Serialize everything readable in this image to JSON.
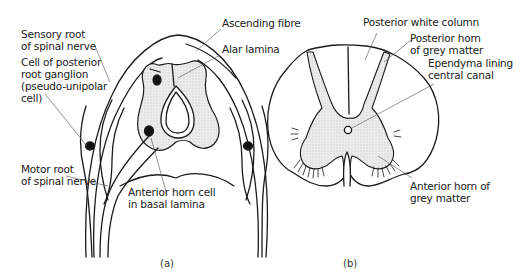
{
  "figure_a": {
    "caption": "(a)",
    "labels": {
      "sensory_root": "Sensory root\nof spinal nerve",
      "ganglion_cell": "Cell of posterior\nroot ganglion\n(pseudo-unipolar\ncell)",
      "motor_root": "Motor root\nof spinal nerve",
      "ascending_fibre": "Ascending fibre",
      "alar_lamina": "Alar lamina",
      "anterior_horn_cell": "Anterior horn cell\nin basal lamina"
    }
  },
  "figure_b": {
    "caption": "(b)",
    "labels": {
      "posterior_white_column": "Posterior white column",
      "posterior_horn": "Posterior horn\nof grey matter",
      "ependyma": "Ependyma lining\ncentral canal",
      "anterior_horn": "Anterior horn of\ngrey matter"
    }
  },
  "colors": {
    "line": "#1a1a1a",
    "grey_matter": "#e4e4e4",
    "leader": "#555555"
  }
}
